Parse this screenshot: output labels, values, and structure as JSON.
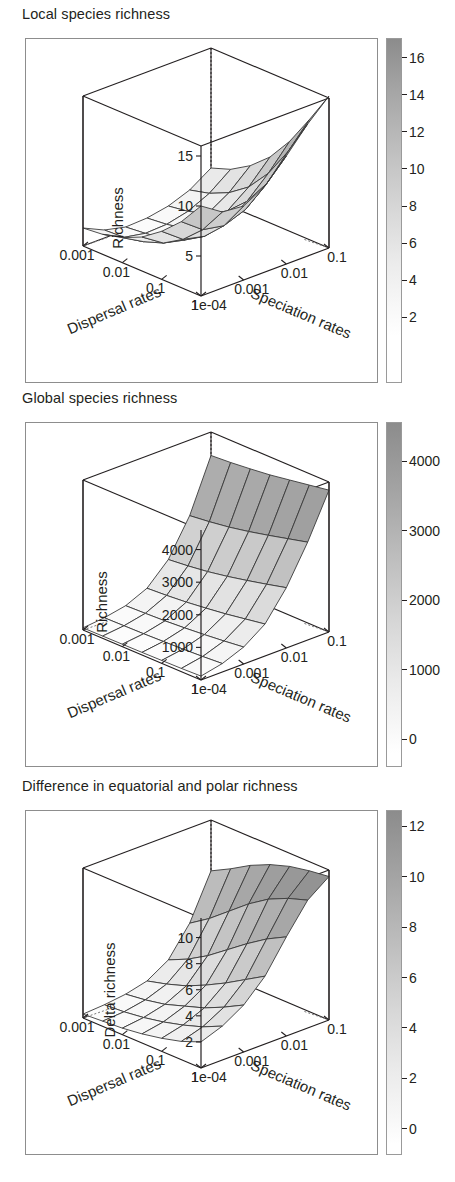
{
  "figure": {
    "background": "#ffffff",
    "ink": "#231f20",
    "frame_color": "#8d8d8d",
    "surface_low_color": "#ffffff",
    "surface_high_color": "#8c8c8c",
    "mesh_color": "#3a3a3a"
  },
  "panels": [
    {
      "id": "local-species-richness",
      "title": "Local species richness",
      "zlabel": "Richness",
      "xlabel": "Dispersal rates",
      "ylabel": "Speciation rates",
      "xticks": [
        "1",
        "0.1",
        "0.01",
        "0.001"
      ],
      "yticks": [
        "1e-04",
        "0.001",
        "0.01",
        "0.1"
      ],
      "zticks": [
        "5",
        "10",
        "15"
      ],
      "colorbar_ticks": [
        "2",
        "4",
        "6",
        "8",
        "10",
        "12",
        "14",
        "16"
      ]
    },
    {
      "id": "global-species-richness",
      "title": "Global species richness",
      "zlabel": "Richness",
      "xlabel": "Dispersal rates",
      "ylabel": "Speciation rates",
      "xticks": [
        "1",
        "0.1",
        "0.01",
        "0.001"
      ],
      "yticks": [
        "1e-04",
        "0.001",
        "0.01",
        "0.1"
      ],
      "zticks": [
        "1000",
        "2000",
        "3000",
        "4000"
      ],
      "colorbar_ticks": [
        "0",
        "1000",
        "2000",
        "3000",
        "4000"
      ]
    },
    {
      "id": "difference-equatorial-polar-richness",
      "title": "Difference in equatorial and polar richness",
      "zlabel": "Delta richness",
      "xlabel": "Dispersal rates",
      "ylabel": "Speciation rates",
      "xticks": [
        "1",
        "0.1",
        "0.01",
        "0.001"
      ],
      "yticks": [
        "1e-04",
        "0.001",
        "0.01",
        "0.1"
      ],
      "zticks": [
        "2",
        "4",
        "6",
        "8",
        "10"
      ],
      "colorbar_ticks": [
        "0",
        "2",
        "4",
        "6",
        "8",
        "10",
        "12"
      ]
    }
  ],
  "chart_data": [
    {
      "type": "surface",
      "title": "Local species richness",
      "xlabel": "Dispersal rates",
      "ylabel": "Speciation rates",
      "zlabel": "Richness",
      "x": [
        1,
        0.1,
        0.01,
        0.001
      ],
      "y": [
        0.0001,
        0.001,
        0.01,
        0.1
      ],
      "x_log_range": [
        0,
        -3
      ],
      "y_log_range": [
        -4,
        -1
      ],
      "zlim": [
        1,
        16
      ],
      "colorbar_range": [
        1,
        17
      ],
      "colorbar_ticks": [
        2,
        4,
        6,
        8,
        10,
        12,
        14,
        16
      ],
      "grid": "7x7 mesh",
      "z_matrix_rows_dispersal_cols_speciation": [
        [
          10.0,
          8.6,
          8.4,
          9.6,
          11.8,
          14.2,
          16.2
        ],
        [
          7.6,
          6.0,
          5.6,
          6.4,
          8.2,
          10.6,
          13.0
        ],
        [
          5.8,
          4.2,
          3.7,
          4.2,
          5.6,
          7.6,
          10.0
        ],
        [
          4.4,
          3.0,
          2.5,
          2.8,
          3.8,
          5.4,
          7.6
        ],
        [
          3.5,
          2.3,
          1.8,
          2.0,
          2.7,
          4.0,
          5.9
        ],
        [
          3.0,
          1.9,
          1.5,
          1.6,
          2.1,
          3.1,
          4.7
        ],
        [
          2.8,
          1.8,
          1.3,
          1.4,
          1.8,
          2.6,
          4.0
        ]
      ],
      "notes": "Saddle/bowl surface: minimum near intermediate dispersal and low speciation; rises to maximum at high speciation & high dispersal."
    },
    {
      "type": "surface",
      "title": "Global species richness",
      "xlabel": "Dispersal rates",
      "ylabel": "Speciation rates",
      "zlabel": "Richness",
      "x": [
        1,
        0.1,
        0.01,
        0.001
      ],
      "y": [
        0.0001,
        0.001,
        0.01,
        0.1
      ],
      "x_log_range": [
        0,
        -3
      ],
      "y_log_range": [
        -4,
        -1
      ],
      "zlim": [
        0,
        4600
      ],
      "colorbar_range": [
        0,
        4400
      ],
      "colorbar_ticks": [
        0,
        1000,
        2000,
        3000,
        4000
      ],
      "grid": "7x7 mesh",
      "z_matrix_rows_dispersal_cols_speciation": [
        [
          120,
          260,
          520,
          980,
          1850,
          3000,
          4350
        ],
        [
          100,
          220,
          450,
          880,
          1700,
          2850,
          4250
        ],
        [
          90,
          190,
          390,
          780,
          1560,
          2700,
          4150
        ],
        [
          80,
          170,
          340,
          700,
          1430,
          2560,
          4050
        ],
        [
          75,
          150,
          300,
          630,
          1320,
          2440,
          3980
        ],
        [
          70,
          140,
          275,
          580,
          1240,
          2350,
          3920
        ],
        [
          65,
          130,
          255,
          545,
          1180,
          2280,
          3880
        ]
      ],
      "notes": "Monotonic rise with speciation rate; steep wall at highest speciation rates, nearly flat at low speciation."
    },
    {
      "type": "surface",
      "title": "Difference in equatorial and polar richness",
      "xlabel": "Dispersal rates",
      "ylabel": "Speciation rates",
      "zlabel": "Delta richness",
      "x": [
        1,
        0.1,
        0.01,
        0.001
      ],
      "y": [
        0.0001,
        0.001,
        0.01,
        0.1
      ],
      "x_log_range": [
        0,
        -3
      ],
      "y_log_range": [
        -4,
        -1
      ],
      "zlim": [
        0,
        11.5
      ],
      "colorbar_range": [
        0,
        12.5
      ],
      "colorbar_ticks": [
        0,
        2,
        4,
        6,
        8,
        10,
        12
      ],
      "grid": "7x7 mesh",
      "z_matrix_rows_dispersal_cols_speciation": [
        [
          2.0,
          2.6,
          3.6,
          5.2,
          7.6,
          9.8,
          11.0
        ],
        [
          1.4,
          1.9,
          2.8,
          4.3,
          6.8,
          9.3,
          10.8
        ],
        [
          1.0,
          1.4,
          2.1,
          3.4,
          5.8,
          8.6,
          10.5
        ],
        [
          0.7,
          1.0,
          1.6,
          2.6,
          4.7,
          7.6,
          10.0
        ],
        [
          0.5,
          0.7,
          1.1,
          1.9,
          3.6,
          6.4,
          9.3
        ],
        [
          0.4,
          0.5,
          0.8,
          1.4,
          2.7,
          5.2,
          8.4
        ],
        [
          0.3,
          0.4,
          0.6,
          1.0,
          2.0,
          4.2,
          7.6
        ]
      ],
      "notes": "Delta richness increases sharply with speciation rate, forming a rising ramp that peaks at high speciation and high dispersal."
    }
  ]
}
